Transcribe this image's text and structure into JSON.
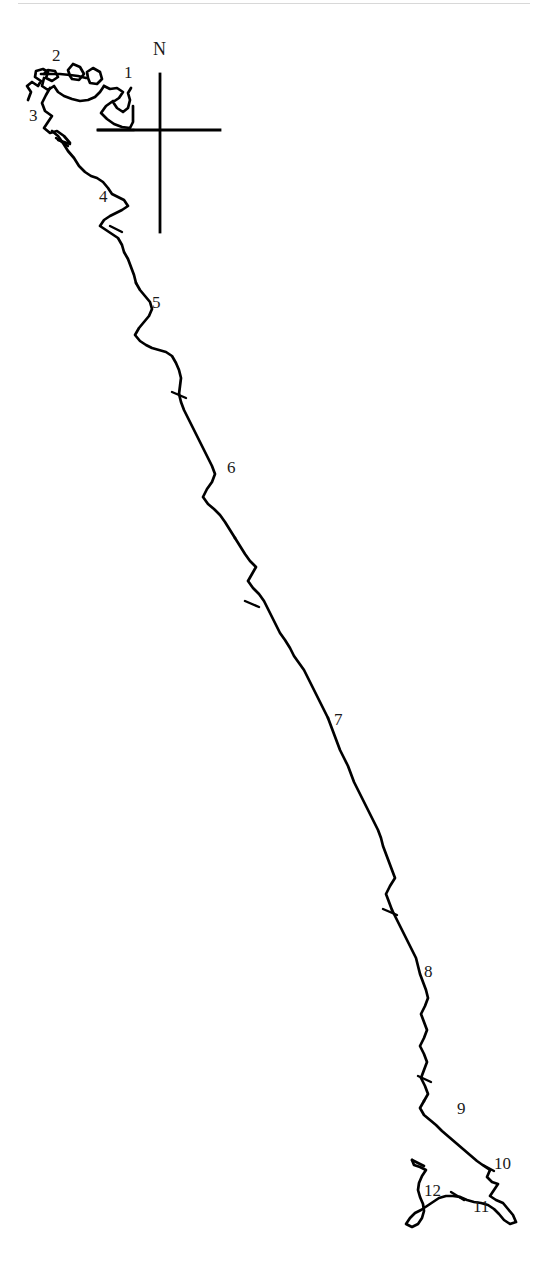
{
  "figure": {
    "kind": "line-drawing-map",
    "background_color": "#ffffff",
    "ink_color": "#000000",
    "width": 542,
    "height": 1262
  },
  "compass": {
    "name": "compass-rose",
    "north_label": "N",
    "label_x": 153,
    "label_y": 48,
    "vertical_x": 160,
    "vertical_top": 74,
    "vertical_bottom": 232,
    "horizontal_y": 130,
    "horizontal_left": 98,
    "horizontal_right": 220
  },
  "labels": [
    {
      "id": "1",
      "text": "1",
      "x": 124,
      "y": 72,
      "tick_x": 133,
      "tick_y": 110
    },
    {
      "id": "2",
      "text": "2",
      "x": 52,
      "y": 55,
      "tick_x": 70,
      "tick_y": 78
    },
    {
      "id": "3",
      "text": "3",
      "x": 30,
      "y": 115,
      "tick_x": 52,
      "tick_y": 133
    },
    {
      "id": "4",
      "text": "4",
      "x": 99,
      "y": 196,
      "tick_x": 116,
      "tick_y": 229
    },
    {
      "id": "5",
      "text": "5",
      "x": 152,
      "y": 302,
      "tick_x": 178,
      "tick_y": 396
    },
    {
      "id": "6",
      "text": "6",
      "x": 227,
      "y": 467,
      "tick_x": 251,
      "tick_y": 604
    },
    {
      "id": "7",
      "text": "7",
      "x": 334,
      "y": 719,
      "tick_x": 389,
      "tick_y": 913
    },
    {
      "id": "8",
      "text": "8",
      "x": 424,
      "y": 971,
      "tick_x": 424,
      "tick_y": 1080
    },
    {
      "id": "9",
      "text": "9",
      "x": 457,
      "y": 1108,
      "tick_x": 470,
      "tick_y": 1165
    },
    {
      "id": "10",
      "text": "10",
      "x": 495,
      "y": 1163,
      "tick_x": 489,
      "tick_y": 1168
    },
    {
      "id": "11",
      "text": "11",
      "x": 474,
      "y": 1206,
      "tick_x": 487,
      "tick_y": 1196
    },
    {
      "id": "12",
      "text": "12",
      "x": 425,
      "y": 1190,
      "tick_x": 420,
      "tick_y": 1172
    }
  ],
  "coastline": {
    "name": "coastline-path",
    "stroke_width": 2.6,
    "path": "M 31 97 L 36 90 L 44 95 L 48 88 L 40 84 L 36 78 L 44 75 L 52 80 L 60 77 L 63 82 L 72 79 L 76 74 L 69 70 L 66 76 L 60 73 L 55 77 L 47 73 L 41 76 L 37 83 L 31 86 L 29 93 Z",
    "main_path": "M 29 96 L 36 89 L 43 93 L 48 86 L 42 81 L 36 82 L 33 76 L 39 72 L 32 70 L 33 63 L 40 66 L 48 64 L 56 68 L 64 66 L 70 70 L 67 62 L 73 58 L 80 62 L 86 69 L 83 75 L 75 78 L 81 83 L 89 80 L 96 72 L 104 74 L 108 81 L 104 88 L 97 90 L 92 84 L 86 88 L 92 94 L 100 97 L 106 94 L 112 99 L 118 106 L 122 100 L 128 94 L 134 97 L 131 104 L 126 110 L 132 116 L 140 121 L 148 124 L 156 126 L 164 128 L 172 129 L 180 130 L 188 130",
    "description": "irregular hand-drawn coastline running from upper-left down to lower-right"
  },
  "page_rule": {
    "name": "page-top-rule",
    "visible": true,
    "color": "#d8d8d8"
  }
}
